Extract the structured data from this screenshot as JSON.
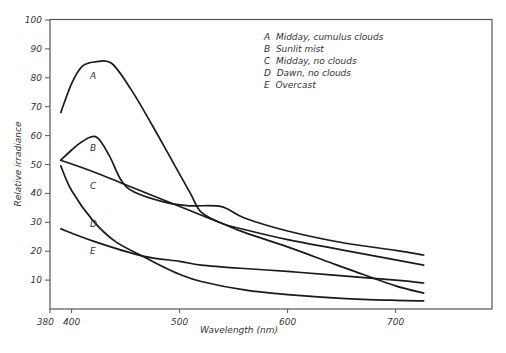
{
  "chart_data": {
    "type": "line",
    "title": "",
    "xlabel": "Wavelength (nm)",
    "ylabel": "Relative irradiance",
    "xlim": [
      380,
      790
    ],
    "ylim": [
      0,
      100
    ],
    "x_ticks": [
      380,
      400,
      500,
      600,
      700
    ],
    "y_ticks": [
      10,
      20,
      30,
      40,
      50,
      60,
      70,
      80,
      90,
      100
    ],
    "grid": false,
    "legend_position": "upper right (inside plot)",
    "legend": [
      {
        "key": "A",
        "label": "Midday, cumulus clouds"
      },
      {
        "key": "B",
        "label": "Sunlit mist"
      },
      {
        "key": "C",
        "label": "Midday, no clouds"
      },
      {
        "key": "D",
        "label": "Dawn, no clouds"
      },
      {
        "key": "E",
        "label": "Overcast"
      }
    ],
    "series": [
      {
        "name": "A",
        "label": "Midday, cumulus clouds",
        "x": [
          390,
          400,
          410,
          422,
          437,
          455,
          474,
          492,
          510,
          520,
          540,
          560,
          600,
          650,
          700,
          726
        ],
        "values": [
          68,
          78,
          84,
          85.5,
          85,
          76,
          64,
          52,
          40,
          33.5,
          29.5,
          27.5,
          24,
          20.5,
          17,
          15.2
        ]
      },
      {
        "name": "B",
        "label": "Sunlit mist",
        "x": [
          390,
          400,
          410,
          423,
          435,
          446,
          458,
          486,
          509,
          538,
          560,
          600,
          650,
          700,
          726
        ],
        "values": [
          51.5,
          55,
          58,
          59.5,
          53,
          44.5,
          40.5,
          37,
          35.7,
          35.5,
          31.5,
          27,
          23,
          20.3,
          18.7
        ]
      },
      {
        "name": "C",
        "label": "Midday, no clouds",
        "x": [
          390,
          420,
          450,
          480,
          510,
          540,
          560,
          600,
          640,
          662,
          700,
          726
        ],
        "values": [
          51.5,
          47.5,
          43,
          38.5,
          34,
          29.5,
          26.5,
          21.5,
          16,
          13,
          8,
          5.5
        ]
      },
      {
        "name": "D",
        "label": "Dawn, no clouds",
        "x": [
          390,
          400,
          420,
          440,
          465,
          480,
          500,
          520,
          560,
          600,
          650,
          700,
          726
        ],
        "values": [
          49.5,
          41,
          30.5,
          23.5,
          18.4,
          15.5,
          12,
          9.5,
          6.6,
          5,
          3.7,
          3,
          2.8
        ]
      },
      {
        "name": "E",
        "label": "Overcast",
        "x": [
          390,
          420,
          465,
          500,
          520,
          560,
          600,
          640,
          700,
          726
        ],
        "values": [
          27.7,
          23.5,
          18.4,
          16.5,
          15.2,
          14,
          13,
          11.8,
          10,
          9
        ]
      }
    ]
  },
  "axes": {
    "x_label": "Wavelength (nm)",
    "y_label": "Relative irradiance",
    "x_tick_labels": [
      "380",
      "400",
      "500",
      "600",
      "700"
    ],
    "y_tick_labels": [
      "10",
      "20",
      "30",
      "40",
      "50",
      "60",
      "70",
      "80",
      "90",
      "100"
    ]
  },
  "legend": {
    "items": [
      "A  Midday, cumulus clouds",
      "B  Sunlit mist",
      "C  Midday, no clouds",
      "D  Dawn, no clouds",
      "E  Overcast"
    ]
  },
  "curve_labels": [
    "A",
    "B",
    "C",
    "D",
    "E"
  ]
}
